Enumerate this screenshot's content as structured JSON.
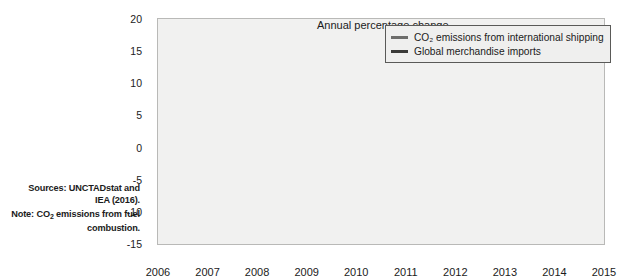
{
  "figure": {
    "axis_title": "Annual percentage change",
    "background_color": "#f1f1f0",
    "frame_color": "#b9b9b7"
  },
  "sidenote": {
    "sources_line1": "Sources: UNCTADstat and",
    "sources_line2": "IEA (2016).",
    "note_line1_pre": "Note: CO",
    "note_line1_sub": "2",
    "note_line1_post": " emissions from fuel",
    "note_line2": "combustion."
  },
  "legend": {
    "position": "top-right",
    "items": [
      {
        "label": "CO₂ emissions from international shipping",
        "color": "#6d6d6b"
      },
      {
        "label": "Global merchandise imports",
        "color": "#3a3a38"
      }
    ]
  },
  "chart_data": {
    "type": "line",
    "title": "Annual percentage change",
    "xlabel": "",
    "ylabel": "Annual percentage change",
    "grid": false,
    "legend_position": "top-right",
    "categories": [
      "2006",
      "2007",
      "2008",
      "2009",
      "2010",
      "2011",
      "2012",
      "2013",
      "2014",
      "2015"
    ],
    "x": [
      2006,
      2007,
      2008,
      2009,
      2010,
      2011,
      2012,
      2013,
      2014,
      2015
    ],
    "xlim": [
      2006,
      2015
    ],
    "ylim": [
      -15,
      20
    ],
    "yticks": [
      20,
      15,
      10,
      5,
      0,
      -5,
      -10,
      -15
    ],
    "xticks": [
      "2006",
      "2007",
      "2008",
      "2009",
      "2010",
      "2011",
      "2012",
      "2013",
      "2014",
      "2015"
    ],
    "series": [
      {
        "name": "CO₂ emissions from international shipping",
        "color": "#6d6d6b",
        "values": [
          6.4,
          5.9,
          1.1,
          -13.5,
          14.0,
          5.4,
          1.8,
          1.8,
          2.4,
          3.0
        ]
      },
      {
        "name": "Global merchandise imports",
        "color": "#3a3a38",
        "values": [
          8.7,
          6.0,
          2.1,
          -5.1,
          7.6,
          3.8,
          -9.8,
          0.8,
          2.3,
          4.4
        ]
      }
    ]
  }
}
